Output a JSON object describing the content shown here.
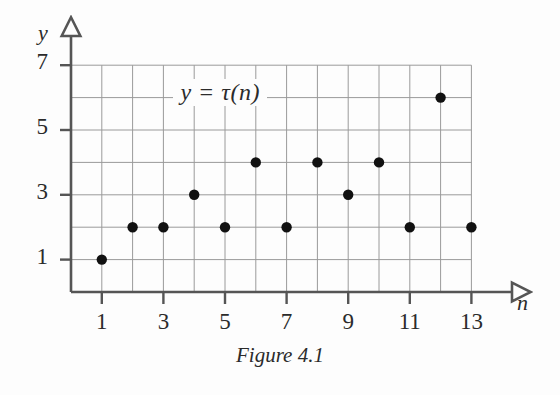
{
  "figure": {
    "caption": "Figure 4.1",
    "curve_label": "y = τ(n)",
    "x_axis_name": "n",
    "y_axis_name": "y",
    "colors": {
      "background": "#fdfdfd",
      "axis": "#555555",
      "grid": "#9a9a9a",
      "point": "#111111",
      "text": "#2b2b2b"
    }
  },
  "chart_data": {
    "type": "scatter",
    "title": "",
    "subtitle": "",
    "annotation": "y = τ(n)",
    "xlabel": "n",
    "ylabel": "y",
    "xlim": [
      0,
      14
    ],
    "ylim": [
      0,
      7.6
    ],
    "grid": true,
    "legend": "none",
    "x_ticks": [
      1,
      3,
      5,
      7,
      9,
      11,
      13
    ],
    "x_tick_labels": [
      "1",
      "3",
      "5",
      "7",
      "9",
      "11",
      "13"
    ],
    "y_ticks": [
      1,
      3,
      5,
      7
    ],
    "y_tick_labels": [
      "1",
      "3",
      "5",
      "7"
    ],
    "x_gridlines": [
      1,
      2,
      3,
      4,
      5,
      6,
      7,
      8,
      9,
      10,
      11,
      12,
      13
    ],
    "y_gridlines": [
      1,
      2,
      3,
      4,
      5,
      6,
      7
    ],
    "x": [
      1,
      2,
      3,
      4,
      5,
      6,
      7,
      8,
      9,
      10,
      11,
      12,
      13
    ],
    "values": [
      1,
      2,
      2,
      3,
      2,
      4,
      2,
      4,
      3,
      4,
      2,
      6,
      2
    ],
    "series": [
      {
        "name": "y = τ(n)",
        "values": [
          1,
          2,
          2,
          3,
          2,
          4,
          2,
          4,
          3,
          4,
          2,
          6,
          2
        ]
      }
    ],
    "points": [
      {
        "n": 1,
        "tau": 1
      },
      {
        "n": 2,
        "tau": 2
      },
      {
        "n": 3,
        "tau": 2
      },
      {
        "n": 4,
        "tau": 3
      },
      {
        "n": 5,
        "tau": 2
      },
      {
        "n": 6,
        "tau": 4
      },
      {
        "n": 7,
        "tau": 2
      },
      {
        "n": 8,
        "tau": 4
      },
      {
        "n": 9,
        "tau": 3
      },
      {
        "n": 10,
        "tau": 4
      },
      {
        "n": 11,
        "tau": 2
      },
      {
        "n": 12,
        "tau": 6
      },
      {
        "n": 13,
        "tau": 2
      }
    ]
  }
}
